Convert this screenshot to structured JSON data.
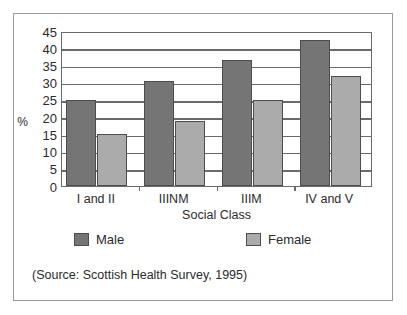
{
  "chart_data": {
    "type": "bar",
    "title": "",
    "xlabel": "Social Class",
    "ylabel": "%",
    "categories": [
      "I and II",
      "IIINM",
      "IIIM",
      "IV and V"
    ],
    "series": [
      {
        "name": "Male",
        "color": "#757575",
        "values": [
          25,
          30.5,
          36.5,
          42.5
        ]
      },
      {
        "name": "Female",
        "color": "#ababab",
        "values": [
          15,
          19,
          25,
          32
        ]
      }
    ],
    "ylim": [
      0,
      45
    ],
    "yticks": [
      0,
      5,
      10,
      15,
      20,
      25,
      30,
      35,
      40,
      45
    ],
    "ytick_labels": [
      "0",
      "5",
      "10",
      "15",
      "20",
      "25",
      "30",
      "35",
      "40",
      "45"
    ],
    "grid": true,
    "grid_axis": "y",
    "legend_position": "below-axis",
    "annotations": [
      "(Source: Scottish Health Survey, 1995)"
    ]
  },
  "figure": {
    "source_note": "(Source: Scottish Health Survey, 1995)",
    "frame_color": "#9a9a9a",
    "axis_color": "#6a6a6a",
    "bar_outline_color": "#4d4d4d"
  }
}
